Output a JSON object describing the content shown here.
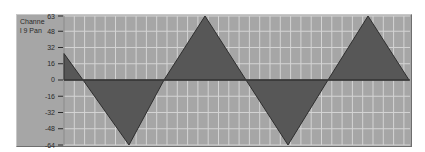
{
  "chart_panel": {
    "label": "Channel 9 Pan",
    "colors": {
      "background": "#a6a6a6",
      "grid": "#d4d4d4",
      "fill": "#575757",
      "line": "#2e2e2e",
      "zero_line": "#3a3a3a"
    }
  },
  "chart_data": {
    "type": "area",
    "title": "Channel 9 Pan",
    "xlabel": "",
    "ylabel": "",
    "ylim": [
      -64,
      63
    ],
    "yticks": [
      63,
      48,
      32,
      16,
      0,
      -16,
      -32,
      -48,
      -64
    ],
    "grid": true,
    "legend": null,
    "x": [
      0,
      19,
      65,
      100,
      141,
      182,
      224,
      264,
      304,
      345
    ],
    "values": [
      26,
      0,
      -64,
      0,
      63,
      0,
      -64,
      0,
      63,
      0
    ]
  }
}
